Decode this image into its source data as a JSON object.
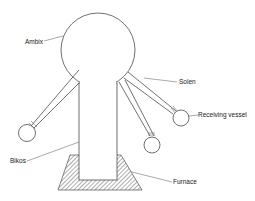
{
  "diagram": {
    "labels": {
      "ambis": "Ambix",
      "solen": "Solen",
      "receiving_vessel": "Receiving vessel",
      "bikos": "Bikos",
      "furnace": "Furnace"
    },
    "colors": {
      "line": "#333333",
      "background": "#ffffff",
      "text": "#222222"
    }
  }
}
